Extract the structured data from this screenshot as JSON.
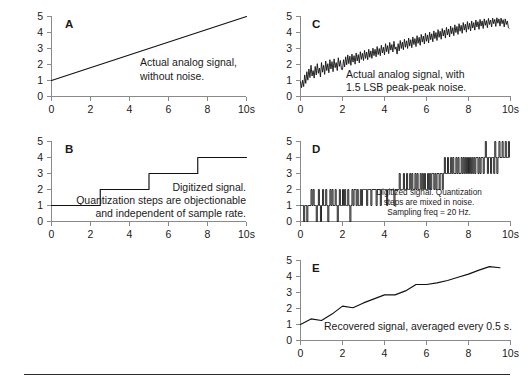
{
  "figure": {
    "background_color": "#ffffff",
    "trace_color": "#111111",
    "axis_color": "#8a8a8a",
    "text_color": "#1a1a1a",
    "has_bottom_rule": true
  },
  "axes": {
    "y_ticks": [
      "0",
      "1",
      "2",
      "3",
      "4",
      "5"
    ],
    "y_values": [
      0,
      1,
      2,
      3,
      4,
      5
    ],
    "x_ticks": [
      "0",
      "2",
      "4",
      "6",
      "8",
      "10s"
    ],
    "x_values": [
      0,
      2,
      4,
      6,
      8,
      10
    ],
    "xlim": [
      0,
      10
    ],
    "ylim": [
      0,
      5
    ],
    "grid": false
  },
  "panels": [
    {
      "letter": "A",
      "caption_lines": [
        "Actual analog signal,",
        "without noise."
      ],
      "caption_align": "left"
    },
    {
      "letter": "B",
      "caption_lines": [
        "Digitized signal.",
        "Quantization steps are objectionable",
        "and independent of sample rate."
      ],
      "caption_align": "right"
    },
    {
      "letter": "C",
      "caption_lines": [
        "Actual analog signal, with",
        "1.5 LSB peak-peak noise."
      ],
      "caption_align": "left"
    },
    {
      "letter": "D",
      "caption_lines": [
        "Digitized signal. Quantization",
        "steps are mixed in noise.",
        "Sampling freq = 20 Hz."
      ],
      "caption_align": "center"
    },
    {
      "letter": "E",
      "caption_lines": [
        "Recovered signal, averaged every 0.5 s."
      ],
      "caption_align": "left"
    }
  ],
  "chart_data": [
    {
      "id": "A",
      "type": "line",
      "title": "Actual analog signal, without noise.",
      "xlabel": "",
      "ylabel": "",
      "xlim": [
        0,
        10
      ],
      "ylim": [
        0,
        5
      ],
      "grid": false,
      "series": [
        {
          "name": "analog ramp",
          "x": [
            0,
            10
          ],
          "values": [
            1.0,
            5.0
          ]
        }
      ]
    },
    {
      "id": "B",
      "type": "line",
      "title": "Digitized signal. Quantization steps are objectionable and independent of sample rate.",
      "xlabel": "",
      "ylabel": "",
      "xlim": [
        0,
        10
      ],
      "ylim": [
        0,
        5
      ],
      "grid": false,
      "series": [
        {
          "name": "quantized staircase",
          "x": [
            0,
            2.5,
            2.5,
            5.0,
            5.0,
            7.5,
            7.5,
            10
          ],
          "values": [
            1,
            1,
            2,
            2,
            3,
            3,
            4,
            4
          ]
        }
      ]
    },
    {
      "id": "C",
      "type": "line",
      "title": "Actual analog signal, with 1.5 LSB peak-peak noise.",
      "xlabel": "",
      "ylabel": "",
      "xlim": [
        0,
        10
      ],
      "ylim": [
        0,
        5
      ],
      "grid": false,
      "noise_peak_to_peak_lsb": 1.5,
      "series": [
        {
          "name": "analog ramp plus noise",
          "x_step": 0.05,
          "values": [
            0.95,
            0.55,
            1.02,
            0.62,
            1.35,
            0.82,
            1.55,
            1.02,
            1.72,
            1.18,
            1.95,
            1.28,
            1.62,
            1.15,
            1.88,
            1.35,
            2.05,
            1.45,
            1.78,
            1.22,
            2.12,
            1.52,
            1.95,
            1.38,
            2.22,
            1.62,
            2.05,
            1.48,
            2.3,
            1.72,
            2.18,
            1.55,
            2.35,
            1.8,
            2.12,
            1.62,
            2.42,
            1.88,
            2.25,
            1.7,
            1.68,
            2.3,
            1.85,
            2.48,
            1.98,
            2.6,
            2.05,
            2.52,
            1.95,
            2.65,
            2.15,
            2.55,
            2.02,
            2.72,
            2.22,
            2.62,
            2.1,
            2.8,
            2.32,
            2.7,
            2.25,
            2.88,
            2.38,
            2.78,
            2.3,
            2.95,
            2.45,
            2.85,
            2.38,
            3.02,
            2.55,
            2.95,
            2.48,
            3.12,
            2.62,
            3.0,
            2.55,
            3.2,
            2.72,
            3.08,
            2.6,
            3.3,
            2.8,
            3.18,
            2.68,
            3.38,
            2.9,
            3.25,
            2.78,
            3.45,
            2.95,
            3.1,
            2.65,
            3.3,
            2.85,
            3.5,
            3.0,
            3.4,
            2.92,
            3.58,
            3.08,
            3.48,
            3.0,
            3.65,
            3.15,
            3.55,
            3.05,
            3.72,
            3.25,
            3.62,
            3.12,
            3.8,
            3.32,
            3.7,
            3.2,
            3.88,
            3.4,
            3.78,
            3.28,
            3.95,
            3.45,
            3.85,
            3.35,
            4.02,
            3.55,
            3.92,
            3.42,
            4.1,
            3.62,
            4.0,
            3.5,
            4.18,
            3.7,
            4.08,
            3.58,
            4.25,
            3.78,
            4.15,
            3.65,
            4.32,
            3.85,
            4.22,
            3.72,
            4.4,
            3.92,
            4.3,
            3.8,
            4.48,
            4.0,
            4.38,
            3.88,
            4.55,
            4.08,
            4.45,
            3.95,
            4.62,
            4.15,
            4.52,
            4.02,
            4.68,
            4.2,
            4.58,
            4.1,
            4.72,
            4.28,
            4.62,
            4.15,
            4.78,
            4.35,
            4.68,
            4.2,
            4.82,
            4.4,
            4.72,
            4.25,
            4.85,
            4.45,
            4.75,
            4.3,
            4.88,
            4.5,
            4.78,
            4.35,
            4.9,
            4.55,
            4.82,
            4.38,
            4.92,
            4.58,
            4.85,
            4.4,
            4.9,
            4.55,
            4.8,
            4.35,
            4.85,
            4.5,
            4.72,
            4.3,
            4.25
          ]
        }
      ]
    },
    {
      "id": "D",
      "type": "line",
      "title": "Digitized signal. Quantization steps are mixed in noise. Sampling freq = 20 Hz.",
      "xlabel": "",
      "ylabel": "",
      "xlim": [
        0,
        10
      ],
      "ylim": [
        0,
        5
      ],
      "grid": false,
      "sampling_frequency_hz": 20,
      "series": [
        {
          "name": "quantized noisy samples",
          "x_step": 0.05,
          "values": [
            1,
            1,
            1,
            0,
            1,
            1,
            0,
            1,
            1,
            1,
            2,
            1,
            2,
            1,
            1,
            0,
            1,
            2,
            1,
            0,
            1,
            2,
            1,
            1,
            2,
            1,
            0,
            1,
            2,
            1,
            2,
            1,
            1,
            2,
            1,
            0,
            1,
            2,
            1,
            1,
            2,
            1,
            2,
            1,
            1,
            2,
            1,
            0,
            1,
            2,
            1,
            2,
            2,
            1,
            2,
            1,
            1,
            2,
            1,
            2,
            2,
            2,
            2,
            1,
            2,
            2,
            2,
            1,
            2,
            2,
            2,
            2,
            1,
            2,
            2,
            2,
            1,
            2,
            2,
            2,
            2,
            2,
            1,
            2,
            2,
            2,
            2,
            2,
            2,
            1,
            2,
            2,
            2,
            2,
            3,
            2,
            2,
            2,
            3,
            2,
            2,
            3,
            2,
            2,
            3,
            2,
            3,
            2,
            2,
            3,
            2,
            3,
            2,
            2,
            3,
            2,
            3,
            2,
            3,
            2,
            2,
            3,
            2,
            3,
            2,
            3,
            3,
            2,
            3,
            2,
            3,
            3,
            2,
            3,
            3,
            2,
            3,
            4,
            3,
            3,
            4,
            3,
            3,
            4,
            3,
            4,
            3,
            3,
            4,
            3,
            4,
            3,
            3,
            4,
            3,
            4,
            3,
            4,
            3,
            4,
            3,
            4,
            3,
            4,
            3,
            4,
            3,
            4,
            4,
            3,
            4,
            3,
            4,
            4,
            3,
            4,
            5,
            4,
            3,
            4,
            4,
            3,
            4,
            4,
            3,
            5,
            4,
            3,
            4,
            5,
            4,
            4,
            5,
            4,
            4,
            5,
            4,
            4,
            5,
            4
          ]
        }
      ]
    },
    {
      "id": "E",
      "type": "line",
      "title": "Recovered signal, averaged every 0.5 s.",
      "xlabel": "",
      "ylabel": "",
      "xlim": [
        0,
        10
      ],
      "ylim": [
        0,
        5
      ],
      "grid": false,
      "averaging_window_s": 0.5,
      "series": [
        {
          "name": "recovered average",
          "x": [
            0,
            0.5,
            1.0,
            1.5,
            2.0,
            2.5,
            3.0,
            3.5,
            4.0,
            4.5,
            5.0,
            5.5,
            6.0,
            6.5,
            7.0,
            7.5,
            8.0,
            8.5,
            9.0,
            9.5
          ],
          "values": [
            1.0,
            1.35,
            1.25,
            1.65,
            2.15,
            2.05,
            2.35,
            2.6,
            2.85,
            2.85,
            3.1,
            3.5,
            3.5,
            3.6,
            3.75,
            3.95,
            4.15,
            4.4,
            4.62,
            4.55
          ]
        }
      ]
    }
  ]
}
